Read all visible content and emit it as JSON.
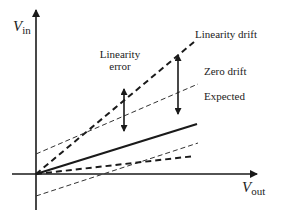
{
  "diagram": {
    "type": "sensor-error-characteristics",
    "axes": {
      "y_label": "V",
      "y_subscript": "in",
      "x_label": "V",
      "x_subscript": "out"
    },
    "lines": [
      {
        "name": "Expected",
        "style": "solid-thick"
      },
      {
        "name": "Linearity drift",
        "style": "dashed-thick"
      },
      {
        "name": "Zero drift",
        "style": "dashed-thin"
      },
      {
        "name": "lower-zero-drift",
        "style": "dashed-thin"
      },
      {
        "name": "lower-linearity-drift",
        "style": "dashed-thick"
      }
    ],
    "labels": {
      "linearity_drift": "Linearity drift",
      "zero_drift": "Zero drift",
      "expected": "Expected",
      "linearity_error_line1": "Linearity",
      "linearity_error_line2": "error"
    },
    "colors": {
      "ink": "#1a1a1a",
      "background": "#ffffff"
    }
  }
}
